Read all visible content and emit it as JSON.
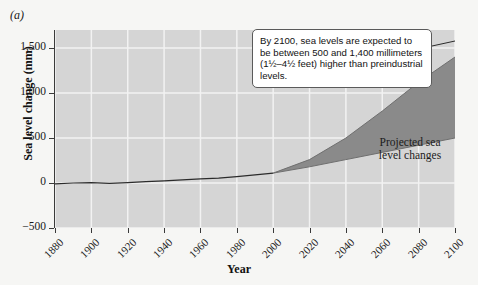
{
  "figure": {
    "panel_label": "(a)",
    "background_color": "#f6f6f4",
    "plot_background_color": "#d5d5d5",
    "gridline_color": "#f2f2f2",
    "band_color": "#8a8a8a",
    "line_color": "#2b2b2b"
  },
  "callout": {
    "text": "By 2100, sea levels are expected to be between 500 and 1,400 millimeters (1½–4½ feet) higher than preindustrial levels."
  },
  "series_label": {
    "line1": "Projected sea",
    "line2": "level changes"
  },
  "chart_data": {
    "type": "area",
    "title": "",
    "xlabel": "Year",
    "ylabel": "Sea level change (mm)",
    "xlim": [
      1880,
      2100
    ],
    "ylim": [
      -500,
      1700
    ],
    "xticks": [
      1880,
      1900,
      1920,
      1940,
      1960,
      1980,
      2000,
      2020,
      2040,
      2060,
      2080,
      2100
    ],
    "xtick_labels": [
      "1880",
      "1900",
      "1920",
      "1940",
      "1960",
      "1980",
      "2000",
      "2020",
      "2040",
      "2060",
      "2080",
      "2100"
    ],
    "yticks": [
      -500,
      0,
      500,
      1000,
      1500
    ],
    "ytick_labels": [
      "−500",
      "0",
      "500",
      "1,000",
      "1,500"
    ],
    "grid": true,
    "legend": "none",
    "annotations": [
      "By 2100, sea levels are expected to be between 500 and 1,400 millimeters (1½–4½ feet) higher than preindustrial levels.",
      "Projected sea level changes"
    ],
    "series": [
      {
        "name": "Observed sea level change",
        "type": "line",
        "x": [
          1880,
          1890,
          1900,
          1910,
          1920,
          1930,
          1940,
          1950,
          1960,
          1970,
          1980,
          1990,
          2000
        ],
        "values": [
          -10,
          0,
          5,
          -5,
          5,
          15,
          25,
          35,
          45,
          55,
          70,
          90,
          110
        ]
      },
      {
        "name": "Projected upper bound",
        "type": "line",
        "x": [
          2000,
          2020,
          2040,
          2060,
          2080,
          2100
        ],
        "values": [
          110,
          260,
          500,
          800,
          1120,
          1400
        ]
      },
      {
        "name": "Projected lower bound",
        "type": "line",
        "x": [
          2000,
          2020,
          2040,
          2060,
          2080,
          2100
        ],
        "values": [
          110,
          180,
          260,
          340,
          420,
          500
        ]
      }
    ],
    "projection_band": {
      "name": "Projected sea level changes",
      "start_year": 2000,
      "end_year": 2100,
      "end_low": 500,
      "end_high": 1400
    }
  }
}
